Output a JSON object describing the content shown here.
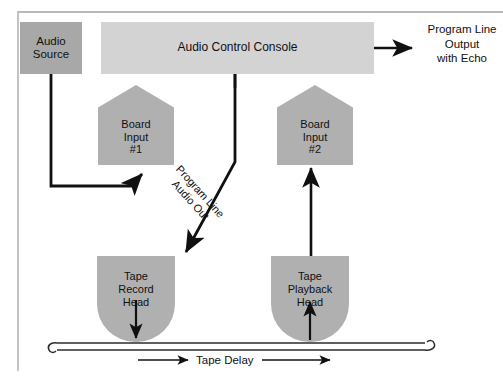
{
  "diagram": {
    "title_nodes": {
      "audio_source": "Audio\nSource",
      "audio_console": "Audio Control Console",
      "board_input_1": "Board\nInput\n#1",
      "board_input_2": "Board\nInput\n#2",
      "tape_record_head": "Tape\nRecord\nHead",
      "tape_playback_head": "Tape\nPlayback\nHead"
    },
    "annotations": {
      "program_output": "Program Line\nOutput\nwith Echo",
      "program_line_audio_out": "Program Line\nAudio Out",
      "tape_delay": "Tape Delay"
    },
    "icons": {
      "arrow_right": "arrow-right-icon",
      "arrow_up": "arrow-up-icon",
      "arrow_down": "arrow-down-icon",
      "arrow_diagonal": "arrow-diagonal-icon",
      "tape_strip": "tape-strip-icon"
    },
    "colors": {
      "source_fill": "#a8a8a8",
      "console_fill": "#d3d3d3",
      "node_fill": "#b0b0b0",
      "line": "#101010",
      "frame": "#b9b9b9",
      "background": "#ffffff"
    }
  }
}
